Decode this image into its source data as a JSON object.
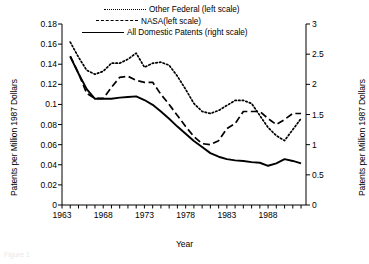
{
  "chart_data": {
    "type": "line",
    "title": "",
    "xlabel": "Year",
    "ylabel": "Patents per Million 1987 Dollars",
    "ylabel_right": "Patents per Million 1987 Dollars",
    "xlim": [
      1963,
      1992
    ],
    "ylim": [
      0,
      0.18
    ],
    "ylim_right": [
      0,
      3
    ],
    "grid": false,
    "legend_position": "top-center",
    "xticks": [
      "1963",
      "1968",
      "1973",
      "1978",
      "1983",
      "1988"
    ],
    "xtick_values": [
      1963,
      1968,
      1973,
      1978,
      1983,
      1988
    ],
    "yticks_left": [
      "0",
      "0.02",
      "0.04",
      "0.06",
      "0.08",
      "0.1",
      "0.12",
      "0.14",
      "0.16",
      "0.18"
    ],
    "ytick_values_left": [
      0,
      0.02,
      0.04,
      0.06,
      0.08,
      0.1,
      0.12,
      0.14,
      0.16,
      0.18
    ],
    "yticks_right": [
      "0",
      "0.5",
      "1",
      "1.5",
      "2",
      "2.5",
      "3"
    ],
    "ytick_values_right": [
      0,
      0.5,
      1,
      1.5,
      2,
      2.5,
      3
    ],
    "x": [
      1964,
      1965,
      1966,
      1967,
      1968,
      1969,
      1970,
      1971,
      1972,
      1973,
      1974,
      1975,
      1976,
      1977,
      1978,
      1979,
      1980,
      1981,
      1982,
      1983,
      1984,
      1985,
      1986,
      1987,
      1988,
      1989,
      1990,
      1991,
      1992
    ],
    "series": [
      {
        "name": "Other Federal (left scale)",
        "axis": "left",
        "style": "dotted",
        "color": "#000000",
        "values": [
          0.162,
          0.147,
          0.134,
          0.13,
          0.133,
          0.141,
          0.141,
          0.145,
          0.151,
          0.137,
          0.141,
          0.142,
          0.139,
          0.128,
          0.115,
          0.101,
          0.093,
          0.091,
          0.094,
          0.099,
          0.104,
          0.104,
          0.101,
          0.089,
          0.077,
          0.069,
          0.064,
          0.075,
          0.086
        ]
      },
      {
        "name": "NASA(left scale)",
        "axis": "left",
        "style": "dashed",
        "color": "#000000",
        "values": [
          0.148,
          0.131,
          0.111,
          0.106,
          0.106,
          0.117,
          0.127,
          0.128,
          0.124,
          0.122,
          0.122,
          0.11,
          0.1,
          0.089,
          0.078,
          0.068,
          0.061,
          0.06,
          0.064,
          0.076,
          0.081,
          0.093,
          0.093,
          0.093,
          0.086,
          0.08,
          0.085,
          0.091,
          0.091
        ]
      },
      {
        "name": "All Domestic Patents (right scale)",
        "axis": "right",
        "style": "solid",
        "color": "#000000",
        "values": [
          2.46,
          2.18,
          1.92,
          1.76,
          1.76,
          1.76,
          1.78,
          1.79,
          1.8,
          1.74,
          1.66,
          1.55,
          1.43,
          1.3,
          1.18,
          1.06,
          0.96,
          0.86,
          0.8,
          0.76,
          0.74,
          0.73,
          0.71,
          0.7,
          0.65,
          0.69,
          0.76,
          0.73,
          0.69
        ]
      }
    ]
  },
  "legend": {
    "items": [
      {
        "label": "Other Federal (left scale)",
        "style": "dotted"
      },
      {
        "label": "NASA(left scale)",
        "style": "dashed"
      },
      {
        "label": "All Domestic Patents (right scale)",
        "style": "solid"
      }
    ]
  },
  "caption": "Figure 1"
}
